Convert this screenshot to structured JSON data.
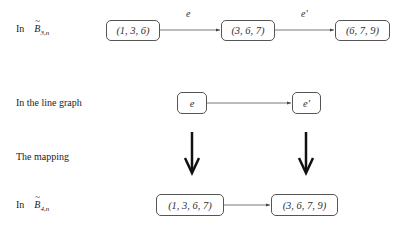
{
  "rows": {
    "row1": {
      "prefix": "In",
      "symbol": "B",
      "subscript": "3,n"
    },
    "row2": {
      "label": "In the line graph"
    },
    "row3": {
      "label": "The mapping"
    },
    "row4": {
      "prefix": "In",
      "symbol": "B",
      "subscript": "4,n"
    }
  },
  "nodes": {
    "b3_a": "(1, 3, 6)",
    "b3_b": "(3, 6, 7)",
    "b3_c": "(6, 7, 9)",
    "lg_e": "e",
    "lg_e2": "e'",
    "b4_a": "(1, 3, 6, 7)",
    "b4_b": "(3, 6, 7, 9)"
  },
  "edges": {
    "b3_ab": "e",
    "b3_bc": "e'"
  },
  "tilde": "~"
}
